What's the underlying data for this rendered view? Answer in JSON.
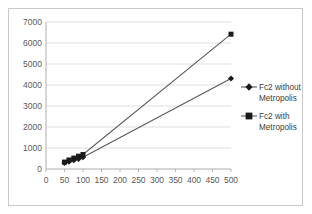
{
  "chart_data": {
    "type": "line",
    "title": "",
    "xlabel": "",
    "ylabel": "",
    "categories": [
      0,
      50,
      100,
      150,
      200,
      250,
      300,
      350,
      400,
      450,
      500
    ],
    "ylim": [
      0,
      7000
    ],
    "ytick_labels": [
      "0",
      "1000",
      "2000",
      "3000",
      "4000",
      "5000",
      "6000",
      "7000"
    ],
    "ytick_values": [
      0,
      1000,
      2000,
      3000,
      4000,
      5000,
      6000,
      7000
    ],
    "xtick_labels": [
      "0",
      "50",
      "100",
      "150",
      "200",
      "250",
      "300",
      "350",
      "400",
      "450",
      "500"
    ],
    "grid": true,
    "legend_position": "right",
    "series": [
      {
        "name": "Fc2 without Metropolis",
        "marker": "diamond",
        "color": "#1a1a1a",
        "x": [
          50,
          62,
          75,
          88,
          100,
          500
        ],
        "values": [
          290,
          350,
          420,
          480,
          560,
          4310
        ]
      },
      {
        "name": "Fc2 with Metropolis",
        "marker": "square",
        "color": "#1a1a1a",
        "x": [
          50,
          62,
          75,
          88,
          100,
          500
        ],
        "values": [
          330,
          430,
          520,
          610,
          690,
          6420
        ]
      }
    ]
  },
  "legend": {
    "entries": [
      {
        "line1": "Fc2 without",
        "line2": "Metropolis",
        "marker": "diamond-marker-icon"
      },
      {
        "line1": "Fc2 with",
        "line2": "Metropolis",
        "marker": "square-marker-icon"
      }
    ]
  }
}
